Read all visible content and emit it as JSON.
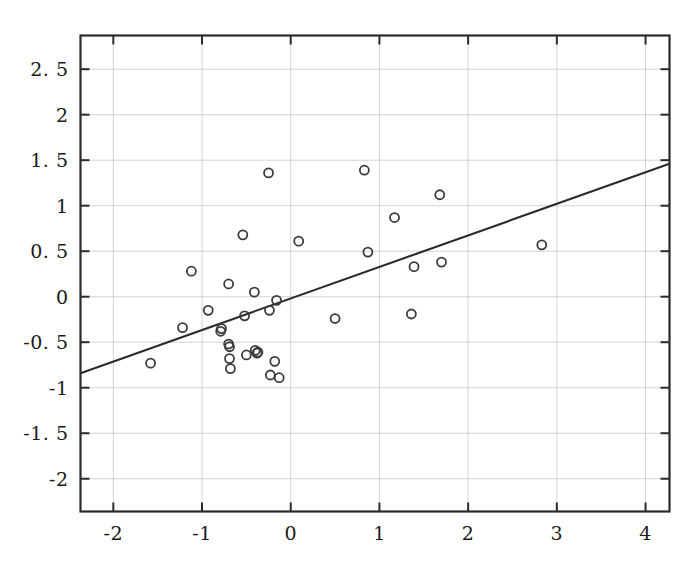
{
  "chart_data": {
    "type": "scatter",
    "title": "",
    "xlabel": "",
    "ylabel": "",
    "xlim": [
      -2.37,
      4.27
    ],
    "ylim": [
      -2.36,
      2.87
    ],
    "grid": true,
    "legend": null,
    "xticks": [
      -2,
      -1,
      0,
      1,
      2,
      3,
      4
    ],
    "xtick_labels": [
      "-2",
      "-1",
      "0",
      "1",
      "2",
      "3",
      "4"
    ],
    "yticks": [
      2.5,
      2,
      1.5,
      1,
      0.5,
      0,
      -0.5,
      -1,
      -1.5,
      -2
    ],
    "ytick_labels": [
      "2. 5",
      "2",
      "1. 5",
      "1",
      "0. 5",
      "0",
      "-0. 5",
      "-1",
      "-1. 5",
      "-2"
    ],
    "marker": "open-circle",
    "marker_color": "#3c3c3c",
    "marker_size": 9,
    "line_color": "#2b2b2b",
    "grid_color": "#c8c8c8",
    "axis_color": "#2b2b2b",
    "background": "#ffffff",
    "series": [
      {
        "name": "observations",
        "points": [
          [
            -1.58,
            -0.73
          ],
          [
            -1.22,
            -0.34
          ],
          [
            -1.12,
            0.28
          ],
          [
            -0.93,
            -0.15
          ],
          [
            -0.79,
            -0.38
          ],
          [
            -0.78,
            -0.35
          ],
          [
            -0.7,
            0.14
          ],
          [
            -0.7,
            -0.52
          ],
          [
            -0.69,
            -0.55
          ],
          [
            -0.69,
            -0.68
          ],
          [
            -0.68,
            -0.79
          ],
          [
            -0.54,
            0.68
          ],
          [
            -0.52,
            -0.21
          ],
          [
            -0.5,
            -0.64
          ],
          [
            -0.41,
            0.05
          ],
          [
            -0.4,
            -0.59
          ],
          [
            -0.38,
            -0.62
          ],
          [
            -0.37,
            -0.61
          ],
          [
            -0.25,
            1.36
          ],
          [
            -0.24,
            -0.15
          ],
          [
            -0.23,
            -0.86
          ],
          [
            -0.18,
            -0.71
          ],
          [
            -0.16,
            -0.04
          ],
          [
            -0.13,
            -0.89
          ],
          [
            0.09,
            0.61
          ],
          [
            0.5,
            -0.24
          ],
          [
            0.83,
            1.39
          ],
          [
            0.87,
            0.49
          ],
          [
            1.17,
            0.87
          ],
          [
            1.36,
            -0.19
          ],
          [
            1.39,
            0.33
          ],
          [
            1.68,
            1.12
          ],
          [
            1.7,
            0.38
          ],
          [
            2.83,
            0.57
          ]
        ]
      }
    ],
    "fit_line": {
      "name": "regression-line",
      "x_start": -2.37,
      "y_start": -0.84,
      "x_end": 4.27,
      "y_end": 1.46,
      "slope": 0.347,
      "intercept": -0.018
    }
  }
}
